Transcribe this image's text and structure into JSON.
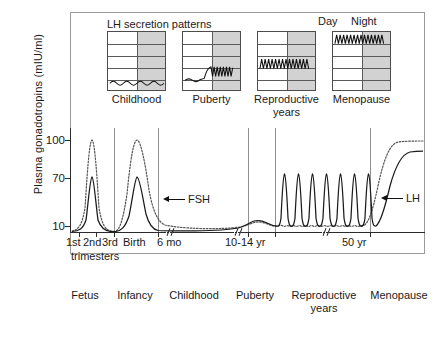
{
  "figure": {
    "ylabel": "Plasma gonadotropins (mIU/ml)",
    "inset_title": "LH secretion patterns",
    "day_label": "Day",
    "night_label": "Night"
  },
  "annotations": [
    {
      "name": "fsh",
      "label": "FSH"
    },
    {
      "name": "lh",
      "label": "LH"
    }
  ],
  "insets": [
    {
      "name": "childhood",
      "caption": "Childhood",
      "caption2": ""
    },
    {
      "name": "puberty",
      "caption": "Puberty",
      "caption2": ""
    },
    {
      "name": "reproductive",
      "caption": "Reproductive",
      "caption2": "years"
    },
    {
      "name": "menopause",
      "caption": "Menopause",
      "caption2": ""
    }
  ],
  "axis": {
    "yticks": [
      "100",
      "70",
      "10"
    ],
    "xticks": [
      "1st",
      "2nd",
      "3rd",
      "Birth",
      "6 mo",
      "10-14 yr",
      "50 yr"
    ],
    "xtick_sub": "trimesters"
  },
  "stages": [
    "Fetus",
    "Infancy",
    "Childhood",
    "Puberty",
    "Reproductive years",
    "Menopause"
  ],
  "colors": {
    "lh_stroke": "#1a1a1a",
    "fsh_stroke": "#555555",
    "night_shade": "#d2d2d2",
    "frame": "#9a9a9a",
    "divider": "#8e8e8e"
  },
  "chart_data": {
    "type": "line",
    "xlabel": "",
    "ylabel": "Plasma gonadotropins (mIU/ml)",
    "ylim": [
      0,
      110
    ],
    "ytick_values": [
      100,
      70,
      10
    ],
    "grid": false,
    "legend": [
      "FSH",
      "LH"
    ],
    "legend_position": "inline-annotation",
    "x_axis_note": "Non-linear lifespan axis with two break marks (//): after 6 mo and during reproductive years",
    "x_stage_boundaries": [
      "Birth",
      "6 mo",
      "10-14 yr",
      "50 yr"
    ],
    "series": [
      {
        "name": "FSH",
        "style": "dotted",
        "description": "Dotted curve: high fetal peak ~100, falls to near 0 at birth, second infancy peak ~98, declines through childhood to ~4, rises at puberty to ~12, low ripples ~8 through reproductive years, steep menopausal rise to plateau ~98",
        "points": [
          {
            "x": "1st trimester",
            "value": 3
          },
          {
            "x": "2nd trimester peak",
            "value": 100
          },
          {
            "x": "3rd trimester",
            "value": 6
          },
          {
            "x": "Birth",
            "value": 2
          },
          {
            "x": "Infancy peak",
            "value": 98
          },
          {
            "x": "6 mo",
            "value": 38
          },
          {
            "x": "Childhood",
            "value": 4
          },
          {
            "x": "Puberty",
            "value": 12
          },
          {
            "x": "Reproductive years mean",
            "value": 8
          },
          {
            "x": "50 yr",
            "value": 9
          },
          {
            "x": "Menopause plateau",
            "value": 98
          }
        ]
      },
      {
        "name": "LH",
        "style": "solid",
        "description": "Solid curve: fetal peak ~45, near 0 at birth, infancy peak ~45, low through childhood ~3, rises at puberty to ~13, nine large cyclic ovulatory spikes peaking ~75 during reproductive years, steep menopausal rise to plateau ~88",
        "points": [
          {
            "x": "1st trimester",
            "value": 2
          },
          {
            "x": "2nd trimester peak",
            "value": 45
          },
          {
            "x": "3rd trimester",
            "value": 4
          },
          {
            "x": "Birth",
            "value": 1
          },
          {
            "x": "Infancy peak",
            "value": 45
          },
          {
            "x": "6 mo",
            "value": 3
          },
          {
            "x": "Childhood",
            "value": 3
          },
          {
            "x": "Puberty",
            "value": 13
          },
          {
            "x": "Reproductive spike peak",
            "value": 75
          },
          {
            "x": "Reproductive trough",
            "value": 8
          },
          {
            "x": "Menopause plateau",
            "value": 88
          }
        ],
        "reproductive_spike_count": 9
      }
    ],
    "insets": [
      {
        "name": "Childhood",
        "pattern": "Low amplitude, low frequency LH waves, equal during day and night",
        "rows": 5,
        "wave_level": "bottom"
      },
      {
        "name": "Puberty",
        "pattern": "Flat low LH during day, high amplitude sleep-entrained pulses at night",
        "rows": 5,
        "wave_level": "middle"
      },
      {
        "name": "Reproductive years",
        "pattern": "Uniform high amplitude LH pulses across day and night",
        "rows": 5,
        "wave_level": "middle"
      },
      {
        "name": "Menopause",
        "pattern": "Very high amplitude LH pulses across day and night at elevated baseline",
        "rows": 5,
        "wave_level": "top"
      }
    ]
  }
}
